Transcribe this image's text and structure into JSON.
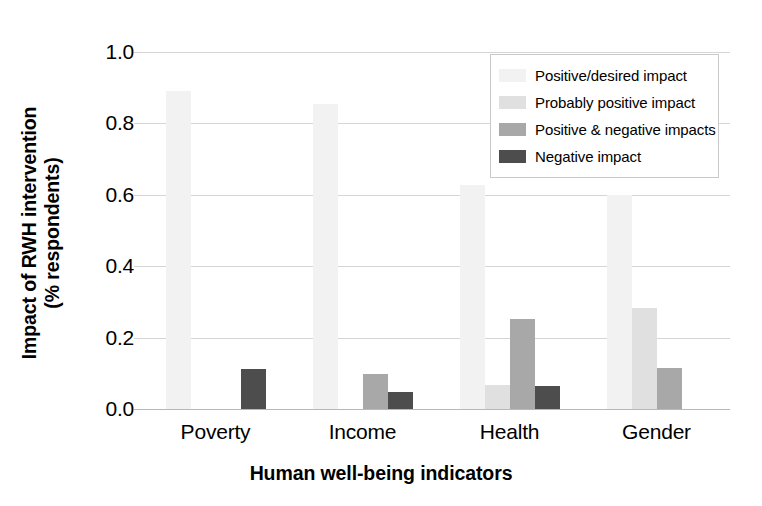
{
  "chart_data": {
    "type": "bar",
    "title": "",
    "xlabel": "Human well-being indicators",
    "ylabel_line1": "Impact of RWH intervention",
    "ylabel_line2": "(% respondents)",
    "categories": [
      "Poverty",
      "Income",
      "Health",
      "Gender"
    ],
    "ylim": [
      0.0,
      1.0
    ],
    "yticks": [
      "0.0",
      "0.2",
      "0.4",
      "0.6",
      "0.8",
      "1.0"
    ],
    "ytick_values": [
      0.0,
      0.2,
      0.4,
      0.6,
      0.8,
      1.0
    ],
    "grid": true,
    "legend_position": "upper right",
    "series": [
      {
        "name": "Positive/desired impact",
        "color": "#f2f2f2",
        "values": [
          0.89,
          0.855,
          0.628,
          0.6
        ]
      },
      {
        "name": "Probably positive impact",
        "color": "#e0e0e0",
        "values": [
          0.0,
          0.0,
          0.066,
          0.283
        ]
      },
      {
        "name": "Positive & negative impacts",
        "color": "#a8a8a8",
        "values": [
          0.0,
          0.098,
          0.252,
          0.115
        ]
      },
      {
        "name": "Negative impact",
        "color": "#4d4d4d",
        "values": [
          0.111,
          0.048,
          0.065,
          0.0
        ]
      }
    ]
  },
  "legend": {
    "items": [
      {
        "label": "Positive/desired impact",
        "color": "#f2f2f2"
      },
      {
        "label": "Probably positive impact",
        "color": "#e0e0e0"
      },
      {
        "label": "Positive & negative impacts",
        "color": "#a8a8a8"
      },
      {
        "label": "Negative impact",
        "color": "#4d4d4d"
      }
    ]
  },
  "colors": {
    "gridline": "#d5d5d5",
    "axis": "#b8b8b8",
    "text": "#000000",
    "background": "#ffffff"
  }
}
